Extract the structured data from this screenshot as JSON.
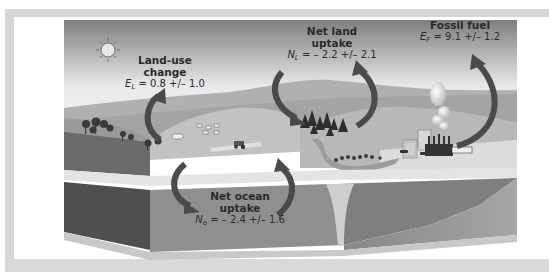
{
  "diagram": {
    "colors": {
      "sky_top": "#8c8c8c",
      "sky_bottom": "#f2f2f2",
      "arrow": "#4a4a4a",
      "frame": "#d6d6d6",
      "ocean_front": "#5c5c5c",
      "ocean_side": "#8a8a8a"
    },
    "labels": {
      "land_use": {
        "title_line1": "Land-use",
        "title_line2": "change",
        "symbol": "E",
        "subscript": "L",
        "equation": "= 0.8 +/– 1.0"
      },
      "net_land": {
        "title_line1": "Net land",
        "title_line2": "uptake",
        "symbol": "N",
        "subscript": "L",
        "equation": "= – 2.2 +/– 2.1"
      },
      "fossil_fuel": {
        "title_line1": "Fossil fuel",
        "symbol": "E",
        "subscript": "F",
        "equation": "= 9.1 +/– 1.2"
      },
      "net_ocean": {
        "title_line1": "Net ocean",
        "title_line2": "uptake",
        "symbol": "N",
        "subscript": "o",
        "equation": "= – 2.4 +/– 1.6"
      }
    },
    "icons": [
      "sun-icon",
      "forest-icon",
      "cattle-icon",
      "tractor-icon",
      "factory-icon",
      "smoke-plume-icon",
      "city-buildings-icon",
      "bus-icon",
      "river-icon"
    ]
  }
}
